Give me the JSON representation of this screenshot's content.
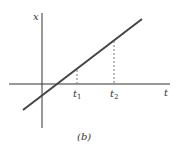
{
  "diagram": {
    "y_axis_label": "x",
    "x_axis_label": "t",
    "marker1": {
      "base": "t",
      "sub": "1"
    },
    "marker2": {
      "base": "t",
      "sub": "2"
    },
    "caption": "(b)",
    "colors": {
      "line": "#444444",
      "axis": "#333333",
      "dashed": "#777777"
    }
  }
}
